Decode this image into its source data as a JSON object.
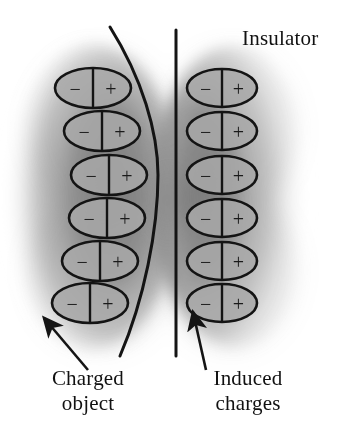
{
  "figure": {
    "type": "physics-diagram",
    "topic": "Polarization of an insulator by a nearby charged object",
    "width": 356,
    "height": 444,
    "background_color": "#ffffff",
    "ink_color": "#1a1a1a"
  },
  "labels": {
    "insulator": "Insulator",
    "charged_object": "Charged\nobject",
    "induced_charges": "Induced\ncharges"
  },
  "dipole": {
    "negative_sign": "−",
    "positive_sign": "+",
    "fill_color": "#a8a8a8",
    "stroke_color": "#141414"
  },
  "columns": [
    {
      "name": "charged-object-column",
      "count": 6,
      "dipoles": [
        {
          "cx": 93,
          "cy": 88,
          "rx": 38,
          "ry": 20
        },
        {
          "cx": 102,
          "cy": 131,
          "rx": 38,
          "ry": 20
        },
        {
          "cx": 109,
          "cy": 175,
          "rx": 38,
          "ry": 20
        },
        {
          "cx": 107,
          "cy": 218,
          "rx": 38,
          "ry": 20
        },
        {
          "cx": 100,
          "cy": 261,
          "rx": 38,
          "ry": 20
        },
        {
          "cx": 90,
          "cy": 303,
          "rx": 38,
          "ry": 20
        }
      ]
    },
    {
      "name": "induced-charges-column",
      "count": 6,
      "dipoles": [
        {
          "cx": 222,
          "cy": 88,
          "rx": 35,
          "ry": 19
        },
        {
          "cx": 222,
          "cy": 131,
          "rx": 35,
          "ry": 19
        },
        {
          "cx": 222,
          "cy": 175,
          "rx": 35,
          "ry": 19
        },
        {
          "cx": 222,
          "cy": 218,
          "rx": 35,
          "ry": 19
        },
        {
          "cx": 222,
          "cy": 261,
          "rx": 35,
          "ry": 19
        },
        {
          "cx": 222,
          "cy": 303,
          "rx": 35,
          "ry": 19
        }
      ]
    }
  ],
  "boundaries": {
    "charged_object_edge": {
      "name": "curved-boundary",
      "path": "M 110 27 C 142 78, 158 132, 158 175 C 158 230, 144 300, 120 356"
    },
    "insulator_edge": {
      "name": "vertical-boundary",
      "x": 176,
      "y1": 30,
      "y2": 356
    }
  },
  "arrows": [
    {
      "name": "charged-object-arrow",
      "x1": 88,
      "y1": 370,
      "x2": 44,
      "y2": 318
    },
    {
      "name": "induced-charges-arrow",
      "x1": 206,
      "y1": 370,
      "x2": 193,
      "y2": 312
    }
  ],
  "shading": {
    "left_blob_color": "#8d8d8d",
    "right_blob_color": "#8d8d8d",
    "description": "soft grey airbrushed regions, darkest near the central divide and fading to white at the outer edges"
  }
}
